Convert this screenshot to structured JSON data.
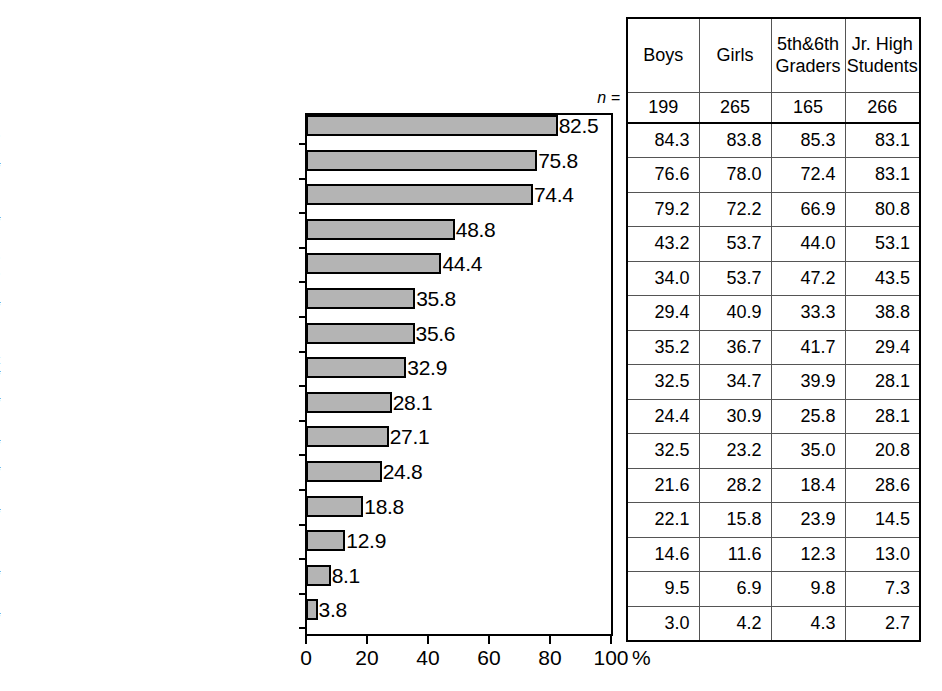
{
  "chart_data": {
    "type": "bar",
    "title": "",
    "xlabel": "%",
    "ylabel": "",
    "xlim": [
      0,
      100
    ],
    "xticks": [
      0,
      20,
      40,
      60,
      80,
      100
    ],
    "xtick_labels": [
      "0",
      "20",
      "40",
      "60",
      "80",
      "100"
    ],
    "percent_sign": "%",
    "grid": false,
    "legend": "none",
    "orientation": "horizontal",
    "categories": [
      "I think keitai must not be used on the train or bus",
      "I think that there are rules for when and where to use keitai",
      "The cost of keitai is a concern",
      "It will give me a sense of relief if keitai allows me to make calls at any time",
      "It makes me happy to think that I will always be getting phone calls",
      "It will make me less fearful to be out alone even at night if I'm carrying keitai",
      "Owning keitai will make me feel grown up",
      "I might be calling my friends without hesitation with keitai",
      "I always feel connected to somebody with keitai",
      "A greater number of people may become involved with bad deeds with keitai",
      "I can keep secrets from my parents if I have keitai",
      "I may have a chance of being involved with bad deeds or fearful situations when carrying keitai",
      "I worry that keitai may be bad for my health",
      "I feel self-conscious when carrying keitai",
      "There is no need to worry even when being around a bully as long as I have keitai"
    ],
    "values": [
      82.5,
      75.8,
      74.4,
      48.8,
      44.4,
      35.8,
      35.6,
      32.9,
      28.1,
      27.1,
      24.8,
      18.8,
      12.9,
      8.1,
      3.8
    ],
    "series": [
      {
        "name": "Boys",
        "n": 199,
        "values": [
          84.3,
          76.6,
          79.2,
          43.2,
          34.0,
          29.4,
          35.2,
          32.5,
          24.4,
          32.5,
          21.6,
          22.1,
          14.6,
          9.5,
          3.0
        ]
      },
      {
        "name": "Girls",
        "n": 265,
        "values": [
          83.8,
          78.0,
          72.2,
          53.7,
          53.7,
          40.9,
          36.7,
          34.7,
          30.9,
          23.2,
          28.2,
          15.8,
          11.6,
          6.9,
          4.2
        ]
      },
      {
        "name": "5th&6th Graders",
        "n": 165,
        "values": [
          85.3,
          72.4,
          66.9,
          44.0,
          47.2,
          33.3,
          41.7,
          39.9,
          25.8,
          35.0,
          18.4,
          23.9,
          12.3,
          9.8,
          4.3
        ]
      },
      {
        "name": "Jr. High Students",
        "n": 266,
        "values": [
          83.1,
          83.1,
          80.8,
          53.1,
          43.5,
          38.8,
          29.4,
          28.1,
          28.1,
          20.8,
          28.6,
          14.5,
          13.0,
          7.3,
          2.7
        ]
      }
    ],
    "bar_fill_color": "#b4b4b4",
    "bar_edge_color": "#000000"
  },
  "rows": [
    {
      "label_lines": [
        [
          {
            "t": "I think ",
            "i": false
          },
          {
            "t": "keitai",
            "i": true
          },
          {
            "t": " must not be",
            "i": false
          }
        ],
        [
          {
            "t": "used on the train or bus",
            "i": false
          }
        ]
      ],
      "value": "82.5",
      "value_num": 82.5,
      "cells": [
        "84.3",
        "83.8",
        "85.3",
        "83.1"
      ]
    },
    {
      "label_lines": [
        [
          {
            "t": "I think that there are rules for when and",
            "i": false
          }
        ],
        [
          {
            "t": "where to use ",
            "i": false
          },
          {
            "t": "keitai",
            "i": true
          }
        ]
      ],
      "value": "75.8",
      "value_num": 75.8,
      "cells": [
        "76.6",
        "78.0",
        "72.4",
        "83.1"
      ]
    },
    {
      "label_lines": [
        [
          {
            "t": "The cost of ",
            "i": false
          },
          {
            "t": "keitai",
            "i": true
          },
          {
            "t": " is a concern",
            "i": false
          }
        ]
      ],
      "value": "74.4",
      "value_num": 74.4,
      "cells": [
        "79.2",
        "72.2",
        "66.9",
        "80.8"
      ]
    },
    {
      "label_lines": [
        [
          {
            "t": "It will give me a sense of relief if ",
            "i": false
          },
          {
            "t": "keitai",
            "i": true
          }
        ],
        [
          {
            "t": "allows me to make calls at any time",
            "i": false
          }
        ]
      ],
      "value": "48.8",
      "value_num": 48.8,
      "cells": [
        "43.2",
        "53.7",
        "44.0",
        "53.1"
      ]
    },
    {
      "label_lines": [
        [
          {
            "t": "It makes me happy to think that I will always",
            "i": false
          }
        ],
        [
          {
            "t": "be getting phone calls",
            "i": false
          }
        ]
      ],
      "value": "44.4",
      "value_num": 44.4,
      "cells": [
        "34.0",
        "53.7",
        "47.2",
        "43.5"
      ]
    },
    {
      "label_lines": [
        [
          {
            "t": "It will make me less fearful to be out alone",
            "i": false
          }
        ],
        [
          {
            "t": "even at night if  I'm carrying ",
            "i": false
          },
          {
            "t": "keitai",
            "i": true
          }
        ]
      ],
      "value": "35.8",
      "value_num": 35.8,
      "cells": [
        "29.4",
        "40.9",
        "33.3",
        "38.8"
      ]
    },
    {
      "label_lines": [
        [
          {
            "t": "Owning ",
            "i": false
          },
          {
            "t": "keitai",
            "i": true
          },
          {
            "t": " will make me feel grown up",
            "i": false
          }
        ]
      ],
      "value": "35.6",
      "value_num": 35.6,
      "cells": [
        "35.2",
        "36.7",
        "41.7",
        "29.4"
      ]
    },
    {
      "label_lines": [
        [
          {
            "t": "I might be calling my friends without",
            "i": false
          }
        ],
        [
          {
            "t": "hesitation with ",
            "i": false
          },
          {
            "t": "keitai",
            "i": true
          }
        ]
      ],
      "value": "32.9",
      "value_num": 32.9,
      "cells": [
        "32.5",
        "34.7",
        "39.9",
        "28.1"
      ]
    },
    {
      "label_lines": [
        [
          {
            "t": "I always feel connected to somebody with ",
            "i": false
          },
          {
            "t": "keitai",
            "i": true
          }
        ]
      ],
      "value": "28.1",
      "value_num": 28.1,
      "cells": [
        "24.4",
        "30.9",
        "25.8",
        "28.1"
      ]
    },
    {
      "label_lines": [
        [
          {
            "t": "A greater number of people may become",
            "i": false
          }
        ],
        [
          {
            "t": "involved with bad deeds with ",
            "i": false
          },
          {
            "t": "keitai",
            "i": true
          }
        ]
      ],
      "value": "27.1",
      "value_num": 27.1,
      "cells": [
        "32.5",
        "23.2",
        "35.0",
        "20.8"
      ]
    },
    {
      "label_lines": [
        [
          {
            "t": "I can keep secrets from my parents if I have ",
            "i": false
          },
          {
            "t": "keitai",
            "i": true
          }
        ]
      ],
      "value": "24.8",
      "value_num": 24.8,
      "cells": [
        "21.6",
        "28.2",
        "18.4",
        "28.6"
      ]
    },
    {
      "label_lines": [
        [
          {
            "t": "I may have a chance of being involved with bad",
            "i": false
          }
        ],
        [
          {
            "t": "deeds or fearful situations when carrying ",
            "i": false
          },
          {
            "t": "keitai",
            "i": true
          }
        ]
      ],
      "value": "18.8",
      "value_num": 18.8,
      "cells": [
        "22.1",
        "15.8",
        "23.9",
        "14.5"
      ]
    },
    {
      "label_lines": [
        [
          {
            "t": "I worry that ",
            "i": false
          },
          {
            "t": "keitai",
            "i": true
          },
          {
            "t": " may be bad for my health",
            "i": false
          }
        ]
      ],
      "value": "12.9",
      "value_num": 12.9,
      "cells": [
        "14.6",
        "11.6",
        "12.3",
        "13.0"
      ]
    },
    {
      "label_lines": [
        [
          {
            "t": "I feel self-conscious when carrying ",
            "i": false
          },
          {
            "t": "keitai",
            "i": true
          }
        ]
      ],
      "value": "8.1",
      "value_num": 8.1,
      "cells": [
        "9.5",
        "6.9",
        "9.8",
        "7.3"
      ]
    },
    {
      "label_lines": [
        [
          {
            "t": "There is no need to worry even when being",
            "i": false
          }
        ],
        [
          {
            "t": "around a bully as long as I have ",
            "i": false
          },
          {
            "t": "keitai",
            "i": true
          }
        ]
      ],
      "value": "3.8",
      "value_num": 3.8,
      "cells": [
        "3.0",
        "4.2",
        "4.3",
        "2.7"
      ]
    }
  ],
  "table": {
    "headers": [
      {
        "line1": "Boys",
        "line2": ""
      },
      {
        "line1": "Girls",
        "line2": ""
      },
      {
        "line1": "5th&6th",
        "line2": "Graders"
      },
      {
        "line1": "Jr. High",
        "line2": "Students"
      }
    ],
    "n_label": "n =",
    "n_values": [
      "199",
      "265",
      "165",
      "266"
    ]
  },
  "axis": {
    "ticks": [
      "0",
      "20",
      "40",
      "60",
      "80",
      "100"
    ],
    "percent": "%"
  }
}
